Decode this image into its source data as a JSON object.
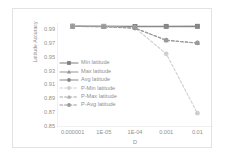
{
  "chart_data": {
    "type": "line",
    "title": "",
    "xlabel": "D",
    "ylabel": "Latitude Accuracy",
    "x": [
      1e-06,
      1e-05,
      0.0001,
      0.001,
      0.01
    ],
    "xtick_labels": [
      "0.000001",
      "1E-05",
      "1E-04",
      "0.001",
      "0.01"
    ],
    "xscale": "categorical-log",
    "ytick_labels": [
      "0.99",
      "0.97",
      "0.95",
      "0.93",
      "0.91",
      "0.89",
      "0.87",
      "0.85"
    ],
    "ytick_values": [
      0.99,
      0.97,
      0.95,
      0.93,
      0.91,
      0.89,
      0.87,
      0.85
    ],
    "ylim": [
      0.85,
      1.0
    ],
    "grid": false,
    "legend_position": "center-left-inside",
    "series": [
      {
        "name": "Min latitude",
        "values": [
          0.9955,
          0.9953,
          0.9951,
          0.9952,
          0.9953
        ],
        "style": "solid",
        "marker": "square",
        "color": "#7f7f7f"
      },
      {
        "name": "Max latitude",
        "values": [
          0.995,
          0.9949,
          0.9946,
          0.9947,
          0.9948
        ],
        "style": "solid",
        "marker": "triangle",
        "color": "#959595"
      },
      {
        "name": "Avg latitude",
        "values": [
          0.9953,
          0.9951,
          0.9949,
          0.995,
          0.9951
        ],
        "style": "solid",
        "marker": "circle",
        "color": "#888888"
      },
      {
        "name": "P-Min latitude",
        "values": [
          0.9955,
          0.995,
          0.993,
          0.9556,
          0.87
        ],
        "style": "dashed",
        "marker": "circle",
        "color": "#cfcfcf"
      },
      {
        "name": "P-Max latitude",
        "values": [
          0.995,
          0.9945,
          0.9925,
          0.975,
          0.971
        ],
        "style": "dashed",
        "marker": "triangle",
        "color": "#a8a8a8"
      },
      {
        "name": "P-Avg latitude",
        "values": [
          0.9952,
          0.9947,
          0.9927,
          0.9752,
          0.9712
        ],
        "style": "dashed",
        "marker": "circle",
        "color": "#9a9a9a"
      }
    ]
  },
  "legend": {
    "items": [
      {
        "label": "Min latitude"
      },
      {
        "label": "Max latitude"
      },
      {
        "label": "Avg latitude"
      },
      {
        "label": "P-Min latitude"
      },
      {
        "label": "P-Max latitude"
      },
      {
        "label": "P-Avg latitude"
      }
    ]
  },
  "colors": {
    "frame_border": "#e3e3e3",
    "axis_line": "#d9d9d9",
    "tick_text": "#8f8f8f",
    "background": "#ffffff"
  }
}
